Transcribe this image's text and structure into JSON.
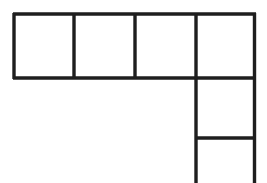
{
  "figure": {
    "canvas": {
      "width": 267,
      "height": 183,
      "background_color": "#ffffff"
    },
    "style": {
      "line_color": "#1e1e1e",
      "line_width": 3.4,
      "fill_color": "none"
    },
    "geometry": {
      "cell_size": 61,
      "origin_x": 13,
      "origin_y": 14,
      "top_row_cells": 4,
      "right_column_cells": 3,
      "column_x_left": 196,
      "column_x_right": 256,
      "x_gridlines": [
        13,
        74,
        135,
        196,
        256
      ],
      "y_gridlines_row": [
        14,
        78
      ],
      "y_gridlines_column": [
        78,
        138,
        183
      ],
      "clipped_at_bottom": true
    },
    "segments": [
      {
        "name": "top-edge",
        "x1": 13,
        "y1": 14,
        "x2": 256,
        "y2": 14
      },
      {
        "name": "row-bottom-edge",
        "x1": 13,
        "y1": 78,
        "x2": 256,
        "y2": 78
      },
      {
        "name": "column-divider-1",
        "x1": 196,
        "y1": 138,
        "x2": 256,
        "y2": 138
      },
      {
        "name": "left-edge",
        "x1": 14,
        "y1": 14,
        "x2": 14,
        "y2": 78
      },
      {
        "name": "vertical-divider-1",
        "x1": 74,
        "y1": 14,
        "x2": 74,
        "y2": 78
      },
      {
        "name": "vertical-divider-2",
        "x1": 135,
        "y1": 14,
        "x2": 135,
        "y2": 78
      },
      {
        "name": "vertical-divider-3",
        "x1": 196,
        "y1": 14,
        "x2": 196,
        "y2": 183
      },
      {
        "name": "right-edge",
        "x1": 255,
        "y1": 14,
        "x2": 255,
        "y2": 183
      }
    ],
    "cells": [
      {
        "name": "cell-row-1",
        "x": 13,
        "y": 14,
        "w": 61,
        "h": 64
      },
      {
        "name": "cell-row-2",
        "x": 74,
        "y": 14,
        "w": 61,
        "h": 64
      },
      {
        "name": "cell-row-3",
        "x": 135,
        "y": 14,
        "w": 61,
        "h": 64
      },
      {
        "name": "cell-row-4",
        "x": 196,
        "y": 14,
        "w": 60,
        "h": 64
      },
      {
        "name": "cell-col-1",
        "x": 196,
        "y": 78,
        "w": 60,
        "h": 60
      },
      {
        "name": "cell-col-2",
        "x": 196,
        "y": 138,
        "w": 60,
        "h": 45
      }
    ]
  }
}
